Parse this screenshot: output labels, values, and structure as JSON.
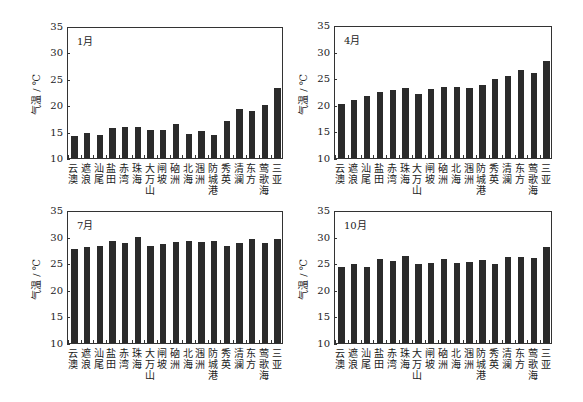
{
  "chart_data": [
    {
      "type": "bar",
      "title": "1月",
      "ylabel": "气温 / ℃",
      "xlabel": "",
      "ylim": [
        10,
        35
      ],
      "yticks": [
        10,
        15,
        20,
        25,
        30,
        35
      ],
      "grid": false,
      "categories": [
        "云澳",
        "遮浪",
        "汕尾",
        "盐田",
        "赤湾",
        "珠海",
        "大万山",
        "闸坡",
        "硇洲",
        "北海",
        "涠洲",
        "防城港",
        "秀英",
        "清澜",
        "东方",
        "莺歌海",
        "三亚"
      ],
      "values": [
        14.2,
        14.8,
        14.3,
        15.7,
        15.8,
        15.9,
        15.3,
        15.4,
        16.4,
        14.5,
        15.2,
        14.3,
        17.1,
        19.2,
        18.9,
        20.1,
        23.2
      ]
    },
    {
      "type": "bar",
      "title": "4月",
      "ylabel": "气温 / ℃",
      "xlabel": "",
      "ylim": [
        10,
        35
      ],
      "yticks": [
        10,
        15,
        20,
        25,
        30,
        35
      ],
      "grid": false,
      "categories": [
        "云澳",
        "遮浪",
        "汕尾",
        "盐田",
        "赤湾",
        "珠海",
        "大万山",
        "闸坡",
        "硇洲",
        "北海",
        "涠洲",
        "防城港",
        "秀英",
        "清澜",
        "东方",
        "莺歌海",
        "三亚"
      ],
      "values": [
        20.2,
        20.9,
        21.7,
        22.5,
        22.8,
        23.1,
        22.1,
        22.9,
        23.4,
        23.4,
        23.1,
        23.8,
        24.9,
        25.5,
        26.5,
        26.0,
        28.3
      ]
    },
    {
      "type": "bar",
      "title": "7月",
      "ylabel": "气温 / ℃",
      "xlabel": "",
      "ylim": [
        10,
        35
      ],
      "yticks": [
        10,
        15,
        20,
        25,
        30,
        35
      ],
      "grid": false,
      "categories": [
        "云澳",
        "遮浪",
        "汕尾",
        "盐田",
        "赤湾",
        "珠海",
        "大万山",
        "闸坡",
        "硇洲",
        "北海",
        "涠洲",
        "防城港",
        "秀英",
        "清澜",
        "东方",
        "莺歌海",
        "三亚"
      ],
      "values": [
        27.7,
        28.0,
        28.2,
        29.2,
        28.8,
        29.9,
        28.2,
        28.6,
        29.0,
        29.2,
        29.0,
        29.2,
        28.3,
        28.8,
        29.5,
        28.8,
        29.6
      ]
    },
    {
      "type": "bar",
      "title": "10月",
      "ylabel": "气温 / ℃",
      "xlabel": "",
      "ylim": [
        10,
        35
      ],
      "yticks": [
        10,
        15,
        20,
        25,
        30,
        35
      ],
      "grid": false,
      "categories": [
        "云澳",
        "遮浪",
        "汕尾",
        "盐田",
        "赤湾",
        "珠海",
        "大万山",
        "闸坡",
        "硇洲",
        "北海",
        "涠洲",
        "防城港",
        "秀英",
        "清澜",
        "东方",
        "莺歌海",
        "三亚"
      ],
      "values": [
        24.3,
        24.8,
        24.3,
        25.7,
        25.5,
        26.4,
        24.9,
        25.1,
        25.7,
        25.0,
        25.2,
        25.6,
        24.8,
        26.1,
        26.2,
        25.9,
        28.0
      ]
    }
  ],
  "style": {
    "bar_color": "#2b2b2b",
    "axis_color": "#333333"
  },
  "layout": [
    {
      "left": 67,
      "top": 27,
      "width": 216,
      "height": 132
    },
    {
      "left": 334,
      "top": 26,
      "width": 218,
      "height": 133
    },
    {
      "left": 67,
      "top": 211,
      "width": 216,
      "height": 133
    },
    {
      "left": 334,
      "top": 211,
      "width": 218,
      "height": 133
    }
  ]
}
